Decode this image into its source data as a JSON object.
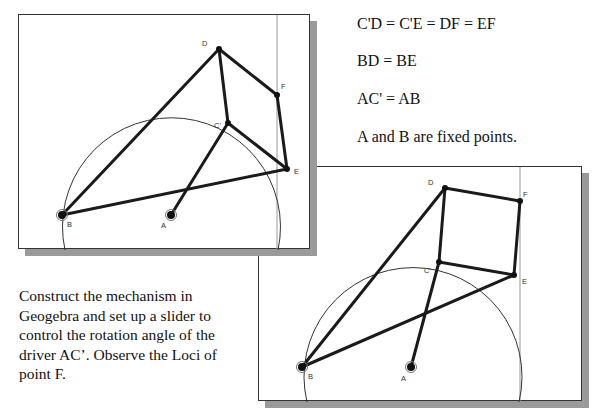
{
  "equations": [
    "C'D = C'E = DF = EF",
    "BD = BE",
    "AC' = AB",
    "A and B are fixed points."
  ],
  "description": "Construct the mechanism in Geogebra and set up a slider to control the rotation angle of the driver AC’. Observe the Loci of point F.",
  "panels": [
    {
      "name": "configuration-1",
      "points": {
        "A": {
          "label": "A",
          "x": 170,
          "y": 214
        },
        "B": {
          "label": "B",
          "x": 61,
          "y": 214
        },
        "C'": {
          "label": "C'",
          "x": 227,
          "y": 122
        },
        "D": {
          "label": "D",
          "x": 218,
          "y": 48
        },
        "E": {
          "label": "E",
          "x": 286,
          "y": 168
        },
        "F": {
          "label": "F",
          "x": 276,
          "y": 94
        }
      }
    },
    {
      "name": "configuration-2",
      "points": {
        "A": {
          "label": "A",
          "x": 410,
          "y": 366
        },
        "B": {
          "label": "B",
          "x": 301,
          "y": 366
        },
        "C'": {
          "label": "C'",
          "x": 438,
          "y": 261
        },
        "D": {
          "label": "D",
          "x": 444,
          "y": 187
        },
        "E": {
          "label": "E",
          "x": 513,
          "y": 274
        },
        "F": {
          "label": "F",
          "x": 519,
          "y": 200
        }
      }
    }
  ],
  "colors": {
    "link": "#1a1a1a",
    "circle": "#333333",
    "guide_line": "#888888",
    "shadow": "#9a9a9a"
  }
}
